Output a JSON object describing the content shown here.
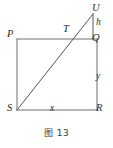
{
  "figure": {
    "caption": "图 13",
    "stroke_color": "#6e6e6e",
    "label_color": "#2b2b2b",
    "background_color": "#ffffff",
    "vertices": [
      {
        "id": "P",
        "label": "P",
        "x": 17,
        "y": 39
      },
      {
        "id": "Q",
        "label": "Q",
        "x": 97,
        "y": 39
      },
      {
        "id": "R",
        "label": "R",
        "x": 97,
        "y": 110
      },
      {
        "id": "S",
        "label": "S",
        "x": 17,
        "y": 110
      },
      {
        "id": "T",
        "label": "T",
        "x": 72,
        "y": 39
      },
      {
        "id": "U",
        "label": "U",
        "x": 93,
        "y": 14
      }
    ],
    "measures": [
      {
        "id": "h",
        "label": "h",
        "segment": "UQ",
        "orientation": "vertical"
      },
      {
        "id": "y",
        "label": "y",
        "segment": "QR",
        "orientation": "vertical"
      },
      {
        "id": "x",
        "label": "x",
        "segment": "SR",
        "orientation": "horizontal"
      }
    ],
    "segments": [
      {
        "id": "PQ",
        "from": "P",
        "to": "Q",
        "kind": "rectangle-side"
      },
      {
        "id": "QR",
        "from": "Q",
        "to": "R",
        "kind": "rectangle-side"
      },
      {
        "id": "RS",
        "from": "R",
        "to": "S",
        "kind": "rectangle-side"
      },
      {
        "id": "SP",
        "from": "S",
        "to": "P",
        "kind": "rectangle-side"
      },
      {
        "id": "SU",
        "from": "S",
        "to": "U",
        "kind": "diagonal-ray"
      },
      {
        "id": "UQ",
        "from": "U",
        "to": "Q",
        "kind": "vertical-extension"
      }
    ]
  }
}
